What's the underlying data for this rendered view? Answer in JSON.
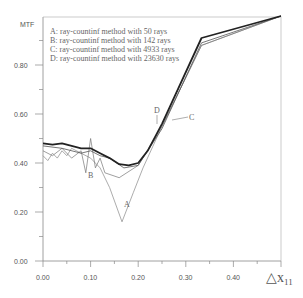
{
  "chart_data": {
    "type": "line",
    "title": "",
    "ylabel": "MTF",
    "xlabel": "△x11",
    "xlim": [
      0,
      0.5
    ],
    "ylim": [
      0,
      1.0
    ],
    "x_ticks": [
      "0.00",
      "0.10",
      "0.20",
      "0.30",
      "0.40"
    ],
    "y_ticks": [
      "0.00",
      "0.20",
      "0.40",
      "0.60",
      "0.80"
    ],
    "legend": [
      "A: ray-countinf method with  50  rays",
      "B: ray-countinf method with  142  rays",
      "C: ray-countinf method with 4933  rays",
      "D: ray-countinf method with  23630  rays"
    ],
    "series": [
      {
        "name": "A",
        "x": [
          0,
          0.01,
          0.02,
          0.03,
          0.04,
          0.05,
          0.06,
          0.08,
          0.1,
          0.12,
          0.14,
          0.166,
          0.19,
          0.21,
          0.25,
          0.333,
          0.5
        ],
        "y": [
          0.43,
          0.41,
          0.44,
          0.42,
          0.45,
          0.43,
          0.46,
          0.44,
          0.42,
          0.38,
          0.3,
          0.16,
          0.28,
          0.38,
          0.55,
          0.88,
          1.0
        ]
      },
      {
        "name": "B",
        "x": [
          0,
          0.02,
          0.04,
          0.06,
          0.08,
          0.09,
          0.1,
          0.11,
          0.12,
          0.13,
          0.16,
          0.2,
          0.25,
          0.333,
          0.5
        ],
        "y": [
          0.45,
          0.43,
          0.46,
          0.42,
          0.45,
          0.36,
          0.5,
          0.38,
          0.42,
          0.36,
          0.34,
          0.39,
          0.55,
          0.88,
          1.0
        ]
      },
      {
        "name": "C",
        "x": [
          0,
          0.04,
          0.08,
          0.1,
          0.12,
          0.14,
          0.17,
          0.2,
          0.25,
          0.333,
          0.5
        ],
        "y": [
          0.47,
          0.46,
          0.44,
          0.45,
          0.43,
          0.42,
          0.38,
          0.39,
          0.54,
          0.89,
          1.0
        ]
      },
      {
        "name": "D",
        "x": [
          0,
          0.02,
          0.04,
          0.06,
          0.08,
          0.1,
          0.12,
          0.14,
          0.16,
          0.18,
          0.2,
          0.22,
          0.25,
          0.333,
          0.5
        ],
        "y": [
          0.48,
          0.475,
          0.48,
          0.47,
          0.46,
          0.46,
          0.44,
          0.42,
          0.395,
          0.39,
          0.4,
          0.45,
          0.56,
          0.91,
          1.0
        ]
      }
    ],
    "annotations": [
      "A",
      "B",
      "C",
      "D"
    ],
    "grid": false
  }
}
